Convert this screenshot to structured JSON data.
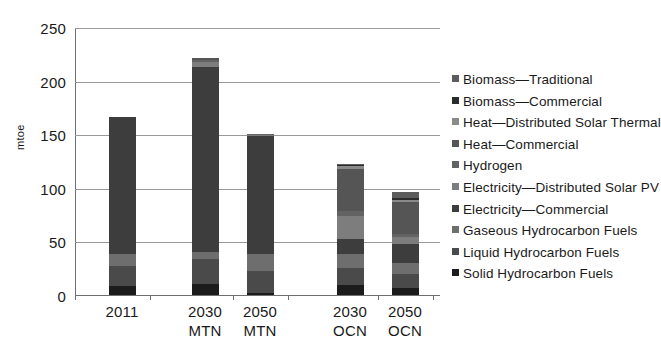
{
  "chart_data": {
    "type": "bar",
    "subtype": "stacked-bar",
    "title": "",
    "xlabel": "",
    "ylabel": "mtoe",
    "ylim": [
      0,
      250
    ],
    "yticks": [
      0,
      50,
      100,
      150,
      200,
      250
    ],
    "grid": true,
    "legend_position": "right",
    "categories": [
      "2011",
      "2030\nMTN",
      "2050\nMTN",
      "2030\nOCN",
      "2050\nOCN"
    ],
    "category_labels_flat": [
      "2011",
      "2030 MTN",
      "2050 MTN",
      "2030 OCN",
      "2050 OCN"
    ],
    "totals": [
      166,
      221,
      150,
      122,
      96
    ],
    "series": [
      {
        "name": "Solid Hydrocarbon Fuels",
        "color": "#1c1c1c",
        "values": [
          8,
          10,
          2,
          9,
          7
        ]
      },
      {
        "name": "Liquid Hydrocarbon Fuels",
        "color": "#4a4a4a",
        "values": [
          19,
          24,
          20,
          16,
          13
        ]
      },
      {
        "name": "Gaseous Hydrocarbon Fuels",
        "color": "#6e6e6e",
        "values": [
          11,
          6,
          16,
          13,
          10
        ]
      },
      {
        "name": "Electricity—Commercial",
        "color": "#3d3d3d",
        "values": [
          128,
          173,
          110,
          14,
          18
        ]
      },
      {
        "name": "Electricity—Distributed Solar PV",
        "color": "#7d7d7d",
        "values": [
          0,
          4,
          1,
          22,
          6
        ]
      },
      {
        "name": "Hydrogen",
        "color": "#636363",
        "values": [
          0,
          2,
          1,
          4,
          3
        ]
      },
      {
        "name": "Heat—Commercial",
        "color": "#555555",
        "values": [
          0,
          2,
          0,
          40,
          30
        ]
      },
      {
        "name": "Heat—Distributed Solar Thermal",
        "color": "#8a8a8a",
        "values": [
          0,
          0,
          0,
          2,
          2
        ]
      },
      {
        "name": "Biomass—Commercial",
        "color": "#2b2b2b",
        "values": [
          0,
          0,
          0,
          1,
          2
        ]
      },
      {
        "name": "Biomass—Traditional",
        "color": "#5c5c5c",
        "values": [
          0,
          0,
          0,
          1,
          5
        ]
      }
    ]
  },
  "legend": {
    "items": [
      {
        "label": "Biomass—Traditional",
        "color": "#5c5c5c"
      },
      {
        "label": "Biomass—Commercial",
        "color": "#2b2b2b"
      },
      {
        "label": "Heat—Distributed Solar Thermal",
        "color": "#8a8a8a"
      },
      {
        "label": "Heat—Commercial",
        "color": "#555555"
      },
      {
        "label": "Hydrogen",
        "color": "#636363"
      },
      {
        "label": "Electricity—Distributed Solar PV",
        "color": "#7d7d7d"
      },
      {
        "label": "Electricity—Commercial",
        "color": "#3d3d3d"
      },
      {
        "label": "Gaseous Hydrocarbon Fuels",
        "color": "#6e6e6e"
      },
      {
        "label": "Liquid Hydrocarbon Fuels",
        "color": "#4a4a4a"
      },
      {
        "label": "Solid Hydrocarbon Fuels",
        "color": "#1c1c1c"
      }
    ]
  },
  "axis": {
    "y_title": "mtoe",
    "y_ticks": [
      "250",
      "200",
      "150",
      "100",
      "50",
      "0"
    ]
  }
}
